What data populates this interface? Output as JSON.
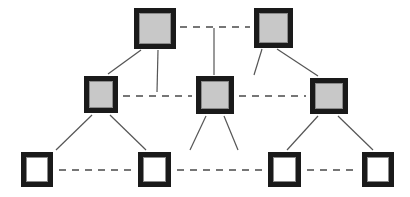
{
  "diagram": {
    "canvas": {
      "width": 410,
      "height": 197,
      "background": "#ffffff"
    },
    "style": {
      "node_border_color": "#1a1a1a",
      "node_fill_shaded": "#c8c8c8",
      "node_fill_empty": "#ffffff",
      "node_inner_outline": "#8a8a8a",
      "link_solid_color": "#555555",
      "link_dashed_color": "#4a4a4a",
      "node_border_width": 5,
      "link_solid_width": 1.2,
      "link_dashed_width": 1.6,
      "link_dash_pattern": "7,6"
    },
    "tiers": [
      {
        "id": "tier-top",
        "level": 0,
        "label": "top",
        "node_fill": "shaded",
        "node_count": 2
      },
      {
        "id": "tier-middle",
        "level": 1,
        "label": "middle",
        "node_fill": "shaded",
        "node_count": 3
      },
      {
        "id": "tier-bottom",
        "level": 2,
        "label": "bottom",
        "node_fill": "empty",
        "node_count": 4
      }
    ],
    "nodes": [
      {
        "id": "t0",
        "tier": 0,
        "index": 0,
        "fill": "shaded",
        "x": 134,
        "y": 8,
        "width": 42,
        "height": 41
      },
      {
        "id": "t1",
        "tier": 0,
        "index": 1,
        "fill": "shaded",
        "x": 254,
        "y": 8,
        "width": 39,
        "height": 40
      },
      {
        "id": "m0",
        "tier": 1,
        "index": 0,
        "fill": "shaded",
        "x": 84,
        "y": 76,
        "width": 34,
        "height": 37
      },
      {
        "id": "m1",
        "tier": 1,
        "index": 1,
        "fill": "shaded",
        "x": 196,
        "y": 76,
        "width": 38,
        "height": 38
      },
      {
        "id": "m2",
        "tier": 1,
        "index": 2,
        "fill": "shaded",
        "x": 310,
        "y": 78,
        "width": 38,
        "height": 36
      },
      {
        "id": "b0",
        "tier": 2,
        "index": 0,
        "fill": "empty",
        "x": 21,
        "y": 152,
        "width": 32,
        "height": 35
      },
      {
        "id": "b1",
        "tier": 2,
        "index": 1,
        "fill": "empty",
        "x": 138,
        "y": 152,
        "width": 33,
        "height": 35
      },
      {
        "id": "b2",
        "tier": 2,
        "index": 2,
        "fill": "empty",
        "x": 268,
        "y": 152,
        "width": 33,
        "height": 35
      },
      {
        "id": "b3",
        "tier": 2,
        "index": 3,
        "fill": "empty",
        "x": 362,
        "y": 152,
        "width": 32,
        "height": 35
      }
    ],
    "peer_links": [
      {
        "id": "peer-t0-t1",
        "style": "dashed",
        "from": "t0",
        "to": "t1",
        "x1": 180,
        "y1": 27,
        "x2": 250,
        "y2": 27
      },
      {
        "id": "peer-m0-m1",
        "style": "dashed",
        "from": "m0",
        "to": "m1",
        "x1": 123,
        "y1": 96,
        "x2": 192,
        "y2": 96
      },
      {
        "id": "peer-m1-m2",
        "style": "dashed",
        "from": "m1",
        "to": "m2",
        "x1": 239,
        "y1": 96,
        "x2": 306,
        "y2": 96
      },
      {
        "id": "peer-b0-b1",
        "style": "dashed",
        "from": "b0",
        "to": "b1",
        "x1": 59,
        "y1": 170,
        "x2": 133,
        "y2": 170
      },
      {
        "id": "peer-b1-b2",
        "style": "dashed",
        "from": "b1",
        "to": "b2",
        "x1": 177,
        "y1": 170,
        "x2": 263,
        "y2": 170
      },
      {
        "id": "peer-b2-b3",
        "style": "dashed",
        "from": "b2",
        "to": "b3",
        "x1": 307,
        "y1": 170,
        "x2": 357,
        "y2": 170
      }
    ],
    "tier_links": [
      {
        "id": "link-t0-m0",
        "style": "solid",
        "from": "t0",
        "to": "m0",
        "x1": 141,
        "y1": 50,
        "x2": 108,
        "y2": 74
      },
      {
        "id": "link-t0-down",
        "style": "solid",
        "from": "t0",
        "to": "peer-m0-m1",
        "x1": 158,
        "y1": 50,
        "x2": 157,
        "y2": 92
      },
      {
        "id": "link-peer-m1",
        "style": "solid",
        "from": "peer-t0-t1",
        "to": "m1",
        "x1": 214,
        "y1": 28,
        "x2": 214,
        "y2": 75
      },
      {
        "id": "link-t1-m1",
        "style": "solid",
        "from": "t1",
        "to": "m1",
        "x1": 262,
        "y1": 49,
        "x2": 254,
        "y2": 75
      },
      {
        "id": "link-t1-m2",
        "style": "solid",
        "from": "t1",
        "to": "m2",
        "x1": 277,
        "y1": 49,
        "x2": 318,
        "y2": 76
      },
      {
        "id": "link-m0-b0",
        "style": "solid",
        "from": "m0",
        "to": "b0",
        "x1": 92,
        "y1": 115,
        "x2": 56,
        "y2": 150
      },
      {
        "id": "link-m0-b1",
        "style": "solid",
        "from": "m0",
        "to": "b1",
        "x1": 110,
        "y1": 115,
        "x2": 146,
        "y2": 150
      },
      {
        "id": "link-m1-b1",
        "style": "solid",
        "from": "m1",
        "to": "b1",
        "x1": 206,
        "y1": 116,
        "x2": 190,
        "y2": 150
      },
      {
        "id": "link-m1-b2",
        "style": "solid",
        "from": "m1",
        "to": "b2",
        "x1": 224,
        "y1": 116,
        "x2": 238,
        "y2": 150
      },
      {
        "id": "link-m2-b2",
        "style": "solid",
        "from": "m2",
        "to": "b2",
        "x1": 318,
        "y1": 116,
        "x2": 287,
        "y2": 150
      },
      {
        "id": "link-m2-b3",
        "style": "solid",
        "from": "m2",
        "to": "b3",
        "x1": 338,
        "y1": 116,
        "x2": 373,
        "y2": 150
      }
    ]
  }
}
